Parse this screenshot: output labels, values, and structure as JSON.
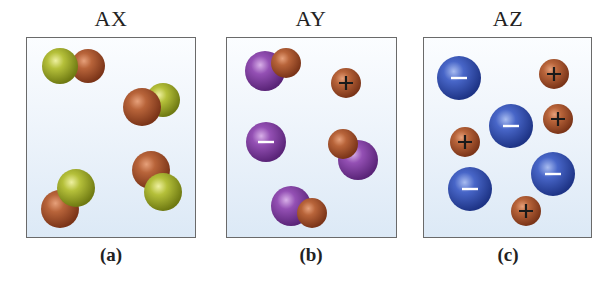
{
  "panels": [
    {
      "id": "a",
      "title": "AX",
      "caption": "(a)",
      "description": "Diatomic AX molecules, no ions"
    },
    {
      "id": "b",
      "title": "AY",
      "caption": "(b)",
      "description": "Mostly AY molecules with one A+ cation and one Y- anion"
    },
    {
      "id": "c",
      "title": "AZ",
      "caption": "(c)",
      "description": "Fully dissociated into A+ cations and Z- anions"
    }
  ],
  "colors": {
    "A_brown": "#a0502a",
    "X_green": "#a8b52a",
    "Y_purple": "#8a45a8",
    "Z_blue": "#3a58b8",
    "panel_border": "#6a6a6a",
    "panel_bg_top": "#fbfdff",
    "panel_bg_bottom": "#dce9f6"
  },
  "symbols": {
    "plus": "+",
    "minus": "−"
  }
}
